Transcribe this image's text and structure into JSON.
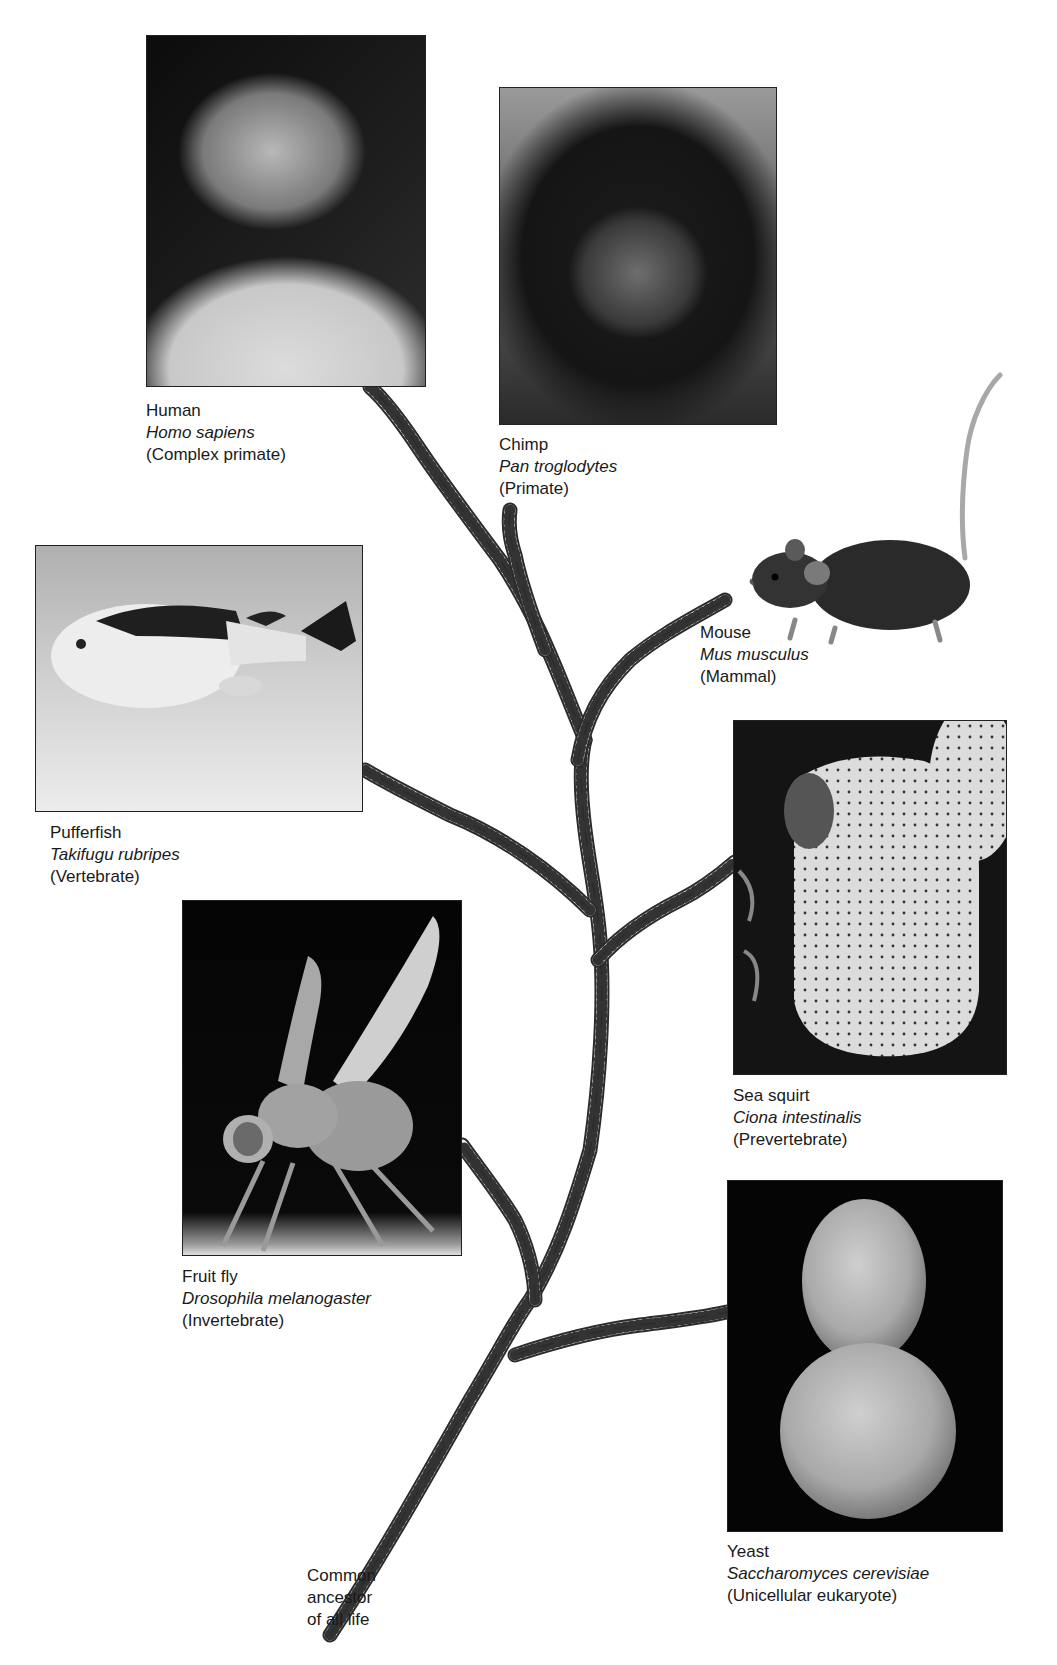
{
  "figure": {
    "type": "evolutionary-tree",
    "trunk_style": "dna-double-helix",
    "root": {
      "label_lines": [
        "Common",
        "ancestor",
        "of all life"
      ]
    },
    "organisms": [
      {
        "id": "human",
        "common": "Human",
        "scientific": "Homo sapiens",
        "classification": "(Complex primate)",
        "image": "portrait-photo"
      },
      {
        "id": "chimp",
        "common": "Chimp",
        "scientific": "Pan troglodytes",
        "classification": "(Primate)",
        "image": "chimpanzee-photo"
      },
      {
        "id": "mouse",
        "common": "Mouse",
        "scientific": "Mus musculus",
        "classification": "(Mammal)",
        "image": "mouse-cutout"
      },
      {
        "id": "pufferfish",
        "common": "Pufferfish",
        "scientific": "Takifugu rubripes",
        "classification": "(Vertebrate)",
        "image": "pufferfish-photo"
      },
      {
        "id": "seasquirt",
        "common": "Sea squirt",
        "scientific": "Ciona intestinalis",
        "classification": "(Prevertebrate)",
        "image": "sea-squirt-photo"
      },
      {
        "id": "fruitfly",
        "common": "Fruit fly",
        "scientific": "Drosophila melanogaster",
        "classification": "(Invertebrate)",
        "image": "fruit-fly-sem"
      },
      {
        "id": "yeast",
        "common": "Yeast",
        "scientific": "Saccharomyces cerevisiae",
        "classification": "(Unicellular eukaryote)",
        "image": "yeast-sem"
      }
    ]
  },
  "colors": {
    "background": "#ffffff",
    "text": "#1a1a1a",
    "dna_stroke": "#333333",
    "dna_fill": "#f2f2f2"
  }
}
